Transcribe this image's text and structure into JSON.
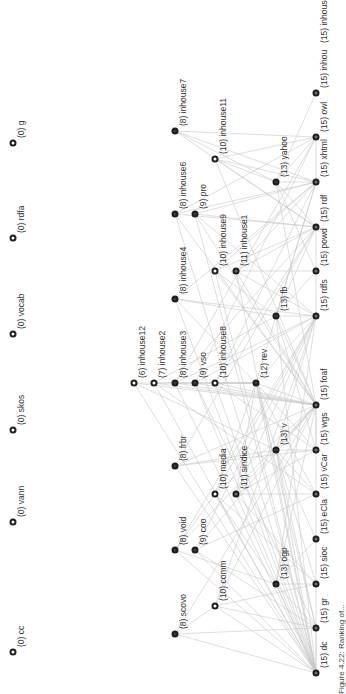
{
  "figure": {
    "caption": "Figure 4.22: Ranking of..."
  },
  "colors": {
    "edge": "#c8c8c8",
    "node_border": "#1e1e1e",
    "node_dark": "#3a3a3a",
    "node_mid": "#6e6e6e",
    "node_hollow": "#ffffff",
    "label": "#333333"
  },
  "nodes": [
    {
      "id": "cc",
      "label": "(0) cc",
      "level": 0,
      "x": 13,
      "y": 652,
      "style": "hollow"
    },
    {
      "id": "vann",
      "label": "(0) vann",
      "level": 0,
      "x": 13,
      "y": 522,
      "style": "hollow"
    },
    {
      "id": "skos",
      "label": "(0) skos",
      "level": 0,
      "x": 13,
      "y": 430,
      "style": "hollow"
    },
    {
      "id": "vocab",
      "label": "(0) vocab",
      "level": 0,
      "x": 13,
      "y": 334,
      "style": "hollow"
    },
    {
      "id": "rdfa",
      "label": "(0) rdfa",
      "level": 0,
      "x": 13,
      "y": 238,
      "style": "hollow"
    },
    {
      "id": "g",
      "label": "(0) g",
      "level": 0,
      "x": 13,
      "y": 143,
      "style": "hollow"
    },
    {
      "id": "inhouse12",
      "label": "(6) inhouse12",
      "level": 6,
      "x": 134,
      "y": 383,
      "style": "hollow"
    },
    {
      "id": "inhouse2",
      "label": "(7) inhouse2",
      "level": 7,
      "x": 154,
      "y": 383,
      "style": "hollow"
    },
    {
      "id": "scovo",
      "label": "(8) scovo",
      "level": 8,
      "x": 175,
      "y": 634,
      "style": "dark"
    },
    {
      "id": "void",
      "label": "(8) void",
      "level": 8,
      "x": 175,
      "y": 550,
      "style": "dark"
    },
    {
      "id": "frbr",
      "label": "(8) frbr",
      "level": 8,
      "x": 175,
      "y": 466,
      "style": "dark"
    },
    {
      "id": "inhouse3",
      "label": "(8) inhouse3",
      "level": 8,
      "x": 175,
      "y": 383,
      "style": "dark"
    },
    {
      "id": "inhouse4",
      "label": "(8) inhouse4",
      "level": 8,
      "x": 175,
      "y": 299,
      "style": "dark"
    },
    {
      "id": "inhouse6",
      "label": "(8) inhouse6",
      "level": 8,
      "x": 175,
      "y": 214,
      "style": "dark"
    },
    {
      "id": "inhouse7",
      "label": "(8) inhouse7",
      "level": 8,
      "x": 175,
      "y": 131,
      "style": "dark"
    },
    {
      "id": "coo",
      "label": "(9) coo",
      "level": 9,
      "x": 195,
      "y": 550,
      "style": "dark"
    },
    {
      "id": "vso",
      "label": "(9) vso",
      "level": 9,
      "x": 195,
      "y": 383,
      "style": "dark"
    },
    {
      "id": "pro",
      "label": "(9) pro",
      "level": 9,
      "x": 195,
      "y": 214,
      "style": "dark"
    },
    {
      "id": "comm",
      "label": "(10) comm",
      "level": 10,
      "x": 215,
      "y": 606,
      "style": "hollow"
    },
    {
      "id": "media",
      "label": "(10) media",
      "level": 10,
      "x": 215,
      "y": 494,
      "style": "hollow"
    },
    {
      "id": "inhouse8",
      "label": "(10) inhouse8",
      "level": 10,
      "x": 215,
      "y": 383,
      "style": "hollow"
    },
    {
      "id": "inhouse9",
      "label": "(10) inhouse9",
      "level": 10,
      "x": 215,
      "y": 271,
      "style": "hollow"
    },
    {
      "id": "inhouse11",
      "label": "(10) inhouse11",
      "level": 10,
      "x": 215,
      "y": 159,
      "style": "hollow"
    },
    {
      "id": "sindice",
      "label": "(11) sindice",
      "level": 11,
      "x": 236,
      "y": 494,
      "style": "mid"
    },
    {
      "id": "inhouse1",
      "label": "(11) inhouse1",
      "level": 11,
      "x": 236,
      "y": 271,
      "style": "mid"
    },
    {
      "id": "rev",
      "label": "(12) rev",
      "level": 12,
      "x": 256,
      "y": 383,
      "style": "dark"
    },
    {
      "id": "ogp",
      "label": "(13) ogp",
      "level": 13,
      "x": 276,
      "y": 584,
      "style": "dark"
    },
    {
      "id": "v",
      "label": "(13) v",
      "level": 13,
      "x": 276,
      "y": 450,
      "style": "dark"
    },
    {
      "id": "fb",
      "label": "(13) fb",
      "level": 13,
      "x": 276,
      "y": 316,
      "style": "dark"
    },
    {
      "id": "yahoo",
      "label": "(13) yahoo",
      "level": 13,
      "x": 276,
      "y": 182,
      "style": "dark"
    },
    {
      "id": "dc",
      "label": "(15) dc",
      "level": 15,
      "x": 316,
      "y": 673,
      "style": "mid"
    },
    {
      "id": "gr",
      "label": "(15) gr",
      "level": 15,
      "x": 316,
      "y": 628,
      "style": "mid"
    },
    {
      "id": "sioc",
      "label": "(15) sioc",
      "level": 15,
      "x": 316,
      "y": 584,
      "style": "mid"
    },
    {
      "id": "eCla",
      "label": "(15) eCla",
      "level": 15,
      "x": 316,
      "y": 539,
      "style": "mid"
    },
    {
      "id": "vCar",
      "label": "(15) vCar",
      "level": 15,
      "x": 316,
      "y": 494,
      "style": "mid"
    },
    {
      "id": "wgs",
      "label": "(15) wgs",
      "level": 15,
      "x": 316,
      "y": 450,
      "style": "mid"
    },
    {
      "id": "foaf",
      "label": "(15) foaf",
      "level": 15,
      "x": 316,
      "y": 405,
      "style": "mid"
    },
    {
      "id": "rdfs",
      "label": "(15) rdfs",
      "level": 15,
      "x": 316,
      "y": 316,
      "style": "mid"
    },
    {
      "id": "powd",
      "label": "(15) powd",
      "level": 15,
      "x": 316,
      "y": 271,
      "style": "mid"
    },
    {
      "id": "rdf",
      "label": "(15) rdf",
      "level": 15,
      "x": 316,
      "y": 227,
      "style": "mid"
    },
    {
      "id": "xhtml",
      "label": "(15) xhtml",
      "level": 15,
      "x": 316,
      "y": 182,
      "style": "mid"
    },
    {
      "id": "owl",
      "label": "(15) owl",
      "level": 15,
      "x": 316,
      "y": 137,
      "style": "mid"
    },
    {
      "id": "inhou",
      "label": "(15) inhou",
      "level": 15,
      "x": 316,
      "y": 93,
      "style": "mid"
    },
    {
      "id": "inhouse10",
      "label": "(15) inhouse10",
      "level": 15,
      "x": 316,
      "y": 48,
      "style": "none"
    }
  ],
  "edges": [
    [
      "inhouse12",
      "rev"
    ],
    [
      "inhouse12",
      "foaf"
    ],
    [
      "inhouse12",
      "v"
    ],
    [
      "inhouse12",
      "dc"
    ],
    [
      "inhouse2",
      "rev"
    ],
    [
      "inhouse2",
      "foaf"
    ],
    [
      "inhouse2",
      "fb"
    ],
    [
      "inhouse2",
      "dc"
    ],
    [
      "inhouse2",
      "vCar"
    ],
    [
      "scovo",
      "dc"
    ],
    [
      "scovo",
      "gr"
    ],
    [
      "scovo",
      "comm"
    ],
    [
      "scovo",
      "foaf"
    ],
    [
      "void",
      "dc"
    ],
    [
      "void",
      "foaf"
    ],
    [
      "void",
      "rdfs"
    ],
    [
      "void",
      "ogp"
    ],
    [
      "void",
      "media"
    ],
    [
      "frbr",
      "dc"
    ],
    [
      "frbr",
      "foaf"
    ],
    [
      "frbr",
      "rdf"
    ],
    [
      "frbr",
      "wgs"
    ],
    [
      "frbr",
      "v"
    ],
    [
      "inhouse3",
      "foaf"
    ],
    [
      "inhouse3",
      "rdf"
    ],
    [
      "inhouse3",
      "rdfs"
    ],
    [
      "inhouse3",
      "rev"
    ],
    [
      "inhouse3",
      "dc"
    ],
    [
      "inhouse3",
      "owl"
    ],
    [
      "inhouse4",
      "rdfs"
    ],
    [
      "inhouse4",
      "xhtml"
    ],
    [
      "inhouse4",
      "rev"
    ],
    [
      "inhouse4",
      "dc"
    ],
    [
      "inhouse4",
      "fb"
    ],
    [
      "inhouse6",
      "rdf"
    ],
    [
      "inhouse6",
      "xhtml"
    ],
    [
      "inhouse6",
      "foaf"
    ],
    [
      "inhouse6",
      "owl"
    ],
    [
      "inhouse6",
      "dc"
    ],
    [
      "inhouse7",
      "xhtml"
    ],
    [
      "inhouse7",
      "owl"
    ],
    [
      "inhouse7",
      "yahoo"
    ],
    [
      "inhouse7",
      "rdf"
    ],
    [
      "coo",
      "dc"
    ],
    [
      "coo",
      "gr"
    ],
    [
      "coo",
      "foaf"
    ],
    [
      "coo",
      "vCar"
    ],
    [
      "coo",
      "rdfs"
    ],
    [
      "vso",
      "gr"
    ],
    [
      "vso",
      "foaf"
    ],
    [
      "vso",
      "rdfs"
    ],
    [
      "vso",
      "dc"
    ],
    [
      "vso",
      "owl"
    ],
    [
      "pro",
      "foaf"
    ],
    [
      "pro",
      "rdf"
    ],
    [
      "pro",
      "xhtml"
    ],
    [
      "pro",
      "dc"
    ],
    [
      "pro",
      "rdfs"
    ],
    [
      "comm",
      "dc"
    ],
    [
      "comm",
      "gr"
    ],
    [
      "comm",
      "foaf"
    ],
    [
      "comm",
      "sioc"
    ],
    [
      "comm",
      "rdfs"
    ],
    [
      "media",
      "dc"
    ],
    [
      "media",
      "foaf"
    ],
    [
      "media",
      "rdfs"
    ],
    [
      "media",
      "sioc"
    ],
    [
      "media",
      "ogp"
    ],
    [
      "media",
      "rev"
    ],
    [
      "inhouse8",
      "foaf"
    ],
    [
      "inhouse8",
      "rdf"
    ],
    [
      "inhouse8",
      "dc"
    ],
    [
      "inhouse8",
      "rev"
    ],
    [
      "inhouse8",
      "xhtml"
    ],
    [
      "inhouse8",
      "wgs"
    ],
    [
      "inhouse9",
      "rdf"
    ],
    [
      "inhouse9",
      "xhtml"
    ],
    [
      "inhouse9",
      "foaf"
    ],
    [
      "inhouse9",
      "dc"
    ],
    [
      "inhouse9",
      "fb"
    ],
    [
      "inhouse11",
      "xhtml"
    ],
    [
      "inhouse11",
      "owl"
    ],
    [
      "inhouse11",
      "yahoo"
    ],
    [
      "inhouse11",
      "rdf"
    ],
    [
      "inhouse11",
      "foaf"
    ],
    [
      "sindice",
      "dc"
    ],
    [
      "sindice",
      "foaf"
    ],
    [
      "sindice",
      "rdfs"
    ],
    [
      "sindice",
      "wgs"
    ],
    [
      "sindice",
      "sioc"
    ],
    [
      "sindice",
      "vCar"
    ],
    [
      "sindice",
      "rev"
    ],
    [
      "inhouse1",
      "rdf"
    ],
    [
      "inhouse1",
      "xhtml"
    ],
    [
      "inhouse1",
      "foaf"
    ],
    [
      "inhouse1",
      "dc"
    ],
    [
      "inhouse1",
      "powd"
    ],
    [
      "inhouse1",
      "rdfs"
    ],
    [
      "rev",
      "foaf"
    ],
    [
      "rev",
      "dc"
    ],
    [
      "rev",
      "wgs"
    ],
    [
      "rev",
      "rdfs"
    ],
    [
      "rev",
      "vCar"
    ],
    [
      "rev",
      "xhtml"
    ],
    [
      "rev",
      "gr"
    ],
    [
      "rev",
      "sioc"
    ],
    [
      "ogp",
      "dc"
    ],
    [
      "ogp",
      "gr"
    ],
    [
      "ogp",
      "foaf"
    ],
    [
      "ogp",
      "sioc"
    ],
    [
      "ogp",
      "eCla"
    ],
    [
      "ogp",
      "rdfs"
    ],
    [
      "v",
      "dc"
    ],
    [
      "v",
      "foaf"
    ],
    [
      "v",
      "vCar"
    ],
    [
      "v",
      "wgs"
    ],
    [
      "v",
      "rdfs"
    ],
    [
      "v",
      "gr"
    ],
    [
      "v",
      "eCla"
    ],
    [
      "fb",
      "dc"
    ],
    [
      "fb",
      "foaf"
    ],
    [
      "fb",
      "rdfs"
    ],
    [
      "fb",
      "rdf"
    ],
    [
      "fb",
      "powd"
    ],
    [
      "fb",
      "xhtml"
    ],
    [
      "fb",
      "wgs"
    ],
    [
      "yahoo",
      "xhtml"
    ],
    [
      "yahoo",
      "owl"
    ],
    [
      "yahoo",
      "rdf"
    ],
    [
      "yahoo",
      "powd"
    ],
    [
      "yahoo",
      "foaf"
    ],
    [
      "yahoo",
      "inhou"
    ],
    [
      "dc",
      "gr"
    ],
    [
      "dc",
      "foaf"
    ],
    [
      "rdf",
      "rdfs"
    ],
    [
      "xhtml",
      "owl"
    ],
    [
      "foaf",
      "wgs"
    ]
  ]
}
